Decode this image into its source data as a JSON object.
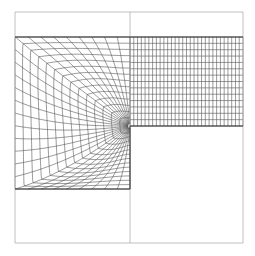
{
  "diagram": {
    "type": "structured-quad-mesh",
    "colors": {
      "background": "#ffffff",
      "outline": "#b0b0b0",
      "mesh": "#555555",
      "boundary": "#333333"
    },
    "outer_box": {
      "x0": 15,
      "y0": 12,
      "x1": 243,
      "y1": 243
    },
    "center_line_x": 130,
    "mesh_top_y": 37,
    "corner": {
      "x": 130,
      "y": 126
    },
    "left_mesh_bottom_y": 189,
    "right_region": {
      "cols": 30,
      "rows": 14
    },
    "left_region": {
      "radial_lines": 30,
      "rings": 14
    }
  }
}
